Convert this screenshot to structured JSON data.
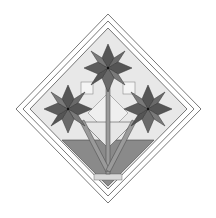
{
  "diagram": {
    "colors": {
      "background": "#ffffff",
      "border_fill": "#ffffff",
      "outline": "#555555",
      "light_fill": "#e6e6e6",
      "star_dark": "#555555",
      "star_mid": "#7a7a7a",
      "basket": "#8a8a8a",
      "stem": "#9a9a9a"
    },
    "elements": [
      {
        "name": "outer-border",
        "label": "Outer border"
      },
      {
        "name": "inner-border",
        "label": "Inner border"
      },
      {
        "name": "top-star",
        "label": "Top star flower"
      },
      {
        "name": "left-star",
        "label": "Left star flower"
      },
      {
        "name": "right-star",
        "label": "Right star flower"
      },
      {
        "name": "stems",
        "label": "Stems"
      },
      {
        "name": "basket",
        "label": "Basket"
      }
    ]
  }
}
